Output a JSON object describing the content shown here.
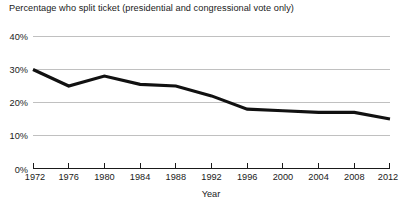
{
  "chart_data": {
    "type": "line",
    "title": "Percentage who split ticket (presidential and congressional vote only)",
    "xlabel": "Year",
    "ylabel": "",
    "x": [
      1972,
      1976,
      1980,
      1984,
      1988,
      1992,
      1996,
      2000,
      2004,
      2008,
      2012
    ],
    "categories": [
      "1972",
      "1976",
      "1980",
      "1984",
      "1988",
      "1992",
      "1996",
      "2000",
      "2004",
      "2008",
      "2012"
    ],
    "values": [
      30,
      25,
      28,
      25.5,
      25,
      22,
      18,
      17.5,
      17,
      17,
      15
    ],
    "series": [
      {
        "name": "Percentage who split ticket",
        "values": [
          30,
          25,
          28,
          25.5,
          25,
          22,
          18,
          17.5,
          17,
          17,
          15
        ]
      }
    ],
    "xlim": [
      1972,
      2012
    ],
    "ylim": [
      0,
      40
    ],
    "yticks": [
      0,
      10,
      20,
      30,
      40
    ],
    "ytick_labels": [
      "0%",
      "10%",
      "20%",
      "30%",
      "40%"
    ],
    "xticks": [
      1972,
      1976,
      1980,
      1984,
      1988,
      1992,
      1996,
      2000,
      2004,
      2008,
      2012
    ],
    "xtick_labels": [
      "1972",
      "1976",
      "1980",
      "1984",
      "1988",
      "1992",
      "1996",
      "2000",
      "2004",
      "2008",
      "2012"
    ],
    "grid": "horizontal",
    "legend": "none",
    "line_color": "#111111",
    "grid_color": "#b9b9b9",
    "axis_color": "#1a1a1a",
    "background_color": "#ffffff"
  },
  "labels": {
    "title": "Percentage who split ticket (presidential and congressional vote only)",
    "x_axis_title": "Year",
    "y_ticks": [
      "40%",
      "30%",
      "20%",
      "10%",
      "0%"
    ],
    "x_ticks": [
      "1972",
      "1976",
      "1980",
      "1984",
      "1988",
      "1992",
      "1996",
      "2000",
      "2004",
      "2008",
      "2012"
    ]
  }
}
